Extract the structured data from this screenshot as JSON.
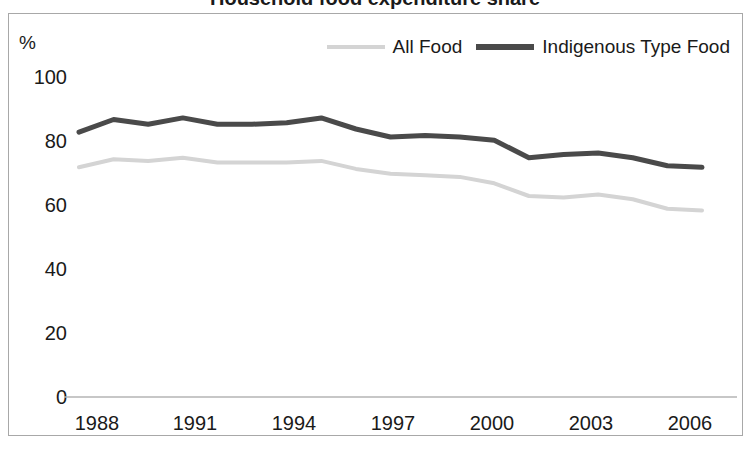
{
  "title": "Household food expenditure share",
  "axis": {
    "y_unit_label": "%",
    "y_ticks": [
      "0",
      "20",
      "40",
      "60",
      "80",
      "100"
    ],
    "x_ticks": [
      "1988",
      "1991",
      "1994",
      "1997",
      "2000",
      "2003",
      "2006"
    ]
  },
  "legend": {
    "items": [
      {
        "label": "All Food",
        "color": "#d4d4d4"
      },
      {
        "label": "Indigenous Type Food",
        "color": "#4a4a4a"
      }
    ]
  },
  "chart_data": {
    "type": "line",
    "title": "Household food expenditure share",
    "xlabel": "",
    "ylabel": "%",
    "ylim": [
      0,
      100
    ],
    "xlim": [
      1988,
      2006
    ],
    "grid": false,
    "legend_position": "top-right",
    "x": [
      1988,
      1989,
      1990,
      1991,
      1992,
      1993,
      1994,
      1995,
      1996,
      1997,
      1998,
      1999,
      2000,
      2001,
      2002,
      2003,
      2004,
      2005,
      2006
    ],
    "categories": [
      "1988",
      "1989",
      "1990",
      "1991",
      "1992",
      "1993",
      "1994",
      "1995",
      "1996",
      "1997",
      "1998",
      "1999",
      "2000",
      "2001",
      "2002",
      "2003",
      "2004",
      "2005",
      "2006"
    ],
    "series": [
      {
        "name": "All Food",
        "color": "#d4d4d4",
        "values": [
          72,
          74.5,
          74,
          75,
          73.5,
          73.5,
          73.5,
          74,
          71.5,
          70,
          69.5,
          69,
          67,
          63,
          62.5,
          63.5,
          62,
          59,
          58.5
        ]
      },
      {
        "name": "Indigenous Type Food",
        "color": "#4a4a4a",
        "values": [
          83,
          87,
          85.5,
          87.5,
          85.5,
          85.5,
          86,
          87.5,
          84,
          81.5,
          82,
          81.5,
          80.5,
          75,
          76,
          76.5,
          75,
          72.5,
          72
        ]
      }
    ]
  }
}
